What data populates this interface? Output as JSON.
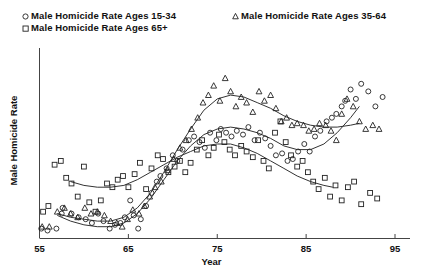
{
  "chart_data": {
    "type": "scatter",
    "title": "",
    "xlabel": "Year",
    "ylabel": "Male Homicide Rate",
    "xlim": [
      55,
      95
    ],
    "ylim": [
      0,
      100
    ],
    "xticks": [
      55,
      65,
      75,
      85,
      95
    ],
    "yticks": [],
    "grid": false,
    "legend_position": "top-left",
    "legend": [
      {
        "label": "Male Homicide Rate Ages 15-34",
        "marker": "circle"
      },
      {
        "label": "Male Homicide Rate Ages 35-64",
        "marker": "triangle"
      },
      {
        "label": "Male Homicide Rate Ages 65+",
        "marker": "square"
      }
    ],
    "series": [
      {
        "name": "Male Homicide Rate Ages 15-34",
        "marker": "circle",
        "points": [
          [
            55.2,
            5
          ],
          [
            55.9,
            4
          ],
          [
            56.9,
            5
          ],
          [
            57.5,
            13
          ],
          [
            57.6,
            16
          ],
          [
            58.6,
            13
          ],
          [
            59.4,
            11
          ],
          [
            60.2,
            10
          ],
          [
            60.9,
            8
          ],
          [
            61.6,
            13
          ],
          [
            62.2,
            9
          ],
          [
            62.9,
            5
          ],
          [
            63.5,
            7
          ],
          [
            64.1,
            8
          ],
          [
            64.6,
            11
          ],
          [
            65.2,
            20
          ],
          [
            65.6,
            12
          ],
          [
            66.1,
            5
          ],
          [
            66.4,
            10
          ],
          [
            67.0,
            17
          ],
          [
            67.6,
            24
          ],
          [
            68.2,
            30
          ],
          [
            68.6,
            33
          ],
          [
            69.3,
            37
          ],
          [
            70.0,
            44
          ],
          [
            70.5,
            41
          ],
          [
            71.1,
            47
          ],
          [
            71.8,
            52
          ],
          [
            72.4,
            54
          ],
          [
            73.0,
            51
          ],
          [
            73.6,
            48
          ],
          [
            74.2,
            56
          ],
          [
            74.9,
            52
          ],
          [
            75.4,
            58
          ],
          [
            76.0,
            56
          ],
          [
            76.6,
            54
          ],
          [
            77.2,
            57
          ],
          [
            77.9,
            55
          ],
          [
            78.5,
            59
          ],
          [
            79.2,
            52
          ],
          [
            79.8,
            56
          ],
          [
            80.4,
            53
          ],
          [
            81.0,
            49
          ],
          [
            81.6,
            44
          ],
          [
            82.3,
            45
          ],
          [
            82.9,
            41
          ],
          [
            83.5,
            42
          ],
          [
            84.1,
            46
          ],
          [
            84.8,
            50
          ],
          [
            85.4,
            46
          ],
          [
            86.0,
            54
          ],
          [
            86.6,
            57
          ],
          [
            87.3,
            62
          ],
          [
            87.9,
            64
          ],
          [
            88.4,
            66
          ],
          [
            89.0,
            70
          ],
          [
            89.4,
            73
          ],
          [
            90.0,
            79
          ],
          [
            90.6,
            74
          ],
          [
            91.2,
            82
          ],
          [
            92.0,
            78
          ],
          [
            92.8,
            70
          ],
          [
            93.6,
            75
          ]
        ]
      },
      {
        "name": "Male Homicide Rate Ages 35-64",
        "marker": "triangle",
        "points": [
          [
            55.3,
            6
          ],
          [
            56.1,
            6
          ],
          [
            57.0,
            14
          ],
          [
            57.8,
            16
          ],
          [
            58.5,
            13
          ],
          [
            59.3,
            11
          ],
          [
            60.1,
            16
          ],
          [
            60.8,
            13
          ],
          [
            61.5,
            14
          ],
          [
            62.3,
            12
          ],
          [
            63.0,
            9
          ],
          [
            63.7,
            8
          ],
          [
            64.3,
            6
          ],
          [
            64.9,
            10
          ],
          [
            65.5,
            15
          ],
          [
            66.2,
            13
          ],
          [
            66.8,
            17
          ],
          [
            67.4,
            22
          ],
          [
            68.0,
            27
          ],
          [
            68.7,
            30
          ],
          [
            69.4,
            36
          ],
          [
            70.1,
            42
          ],
          [
            70.8,
            48
          ],
          [
            71.5,
            52
          ],
          [
            72.1,
            58
          ],
          [
            72.8,
            64
          ],
          [
            73.4,
            72
          ],
          [
            74.0,
            76
          ],
          [
            74.6,
            81
          ],
          [
            75.3,
            73
          ],
          [
            75.9,
            85
          ],
          [
            76.5,
            78
          ],
          [
            77.1,
            70
          ],
          [
            77.7,
            75
          ],
          [
            78.3,
            72
          ],
          [
            79.0,
            67
          ],
          [
            79.7,
            78
          ],
          [
            80.3,
            73
          ],
          [
            81.0,
            76
          ],
          [
            81.6,
            69
          ],
          [
            82.2,
            62
          ],
          [
            82.8,
            64
          ],
          [
            83.4,
            60
          ],
          [
            84.0,
            61
          ],
          [
            84.7,
            60
          ],
          [
            85.3,
            57
          ],
          [
            85.9,
            58
          ],
          [
            86.5,
            61
          ],
          [
            87.2,
            60
          ],
          [
            87.8,
            57
          ],
          [
            88.4,
            52
          ],
          [
            89.0,
            66
          ],
          [
            89.6,
            74
          ],
          [
            90.3,
            70
          ],
          [
            91.0,
            62
          ],
          [
            91.7,
            58
          ],
          [
            92.5,
            60
          ],
          [
            93.2,
            58
          ]
        ]
      },
      {
        "name": "Male Homicide Rate Ages 65+",
        "marker": "square",
        "points": [
          [
            55.4,
            14
          ],
          [
            56.0,
            17
          ],
          [
            56.7,
            39
          ],
          [
            57.4,
            41
          ],
          [
            58.0,
            32
          ],
          [
            58.6,
            29
          ],
          [
            59.3,
            22
          ],
          [
            60.0,
            38
          ],
          [
            60.6,
            19
          ],
          [
            61.3,
            14
          ],
          [
            61.9,
            20
          ],
          [
            62.6,
            29
          ],
          [
            63.2,
            27
          ],
          [
            63.8,
            31
          ],
          [
            64.4,
            33
          ],
          [
            65.0,
            27
          ],
          [
            65.7,
            34
          ],
          [
            66.3,
            40
          ],
          [
            67.0,
            26
          ],
          [
            67.6,
            37
          ],
          [
            68.3,
            44
          ],
          [
            68.9,
            42
          ],
          [
            69.5,
            35
          ],
          [
            70.2,
            38
          ],
          [
            70.8,
            41
          ],
          [
            71.4,
            35
          ],
          [
            72.0,
            40
          ],
          [
            72.7,
            47
          ],
          [
            73.3,
            52
          ],
          [
            74.0,
            44
          ],
          [
            74.6,
            48
          ],
          [
            75.2,
            55
          ],
          [
            75.8,
            51
          ],
          [
            76.4,
            47
          ],
          [
            77.0,
            44
          ],
          [
            77.7,
            49
          ],
          [
            78.3,
            46
          ],
          [
            79.0,
            43
          ],
          [
            79.6,
            52
          ],
          [
            80.2,
            41
          ],
          [
            80.8,
            37
          ],
          [
            81.5,
            56
          ],
          [
            82.1,
            62
          ],
          [
            82.7,
            51
          ],
          [
            83.3,
            44
          ],
          [
            84.0,
            38
          ],
          [
            84.6,
            41
          ],
          [
            85.2,
            35
          ],
          [
            85.8,
            30
          ],
          [
            86.4,
            26
          ],
          [
            87.1,
            32
          ],
          [
            87.7,
            22
          ],
          [
            88.3,
            28
          ],
          [
            89.0,
            20
          ],
          [
            89.7,
            27
          ],
          [
            90.4,
            30
          ],
          [
            91.2,
            18
          ],
          [
            92.2,
            24
          ],
          [
            93.0,
            21
          ]
        ]
      }
    ],
    "fitted_curves": [
      {
        "name": "Male Homicide Rate Ages 15-34",
        "points": [
          [
            57.0,
            12
          ],
          [
            58.5,
            9
          ],
          [
            60.0,
            7
          ],
          [
            61.5,
            6
          ],
          [
            63.0,
            6
          ],
          [
            64.5,
            8
          ],
          [
            66.0,
            13
          ],
          [
            67.5,
            21
          ],
          [
            69.0,
            31
          ],
          [
            70.5,
            41
          ],
          [
            72.0,
            49
          ],
          [
            73.5,
            55
          ],
          [
            75.0,
            58
          ],
          [
            76.5,
            59
          ],
          [
            78.0,
            58
          ],
          [
            79.5,
            56
          ],
          [
            81.0,
            53
          ],
          [
            82.5,
            49
          ],
          [
            84.0,
            47
          ],
          [
            85.5,
            47
          ],
          [
            87.0,
            50
          ],
          [
            88.5,
            56
          ],
          [
            90.0,
            64
          ],
          [
            91.0,
            70
          ]
        ]
      },
      {
        "name": "Male Homicide Rate Ages 35-64",
        "points": [
          [
            57.0,
            13
          ],
          [
            58.5,
            11
          ],
          [
            60.0,
            10
          ],
          [
            61.5,
            9
          ],
          [
            63.0,
            9
          ],
          [
            64.5,
            11
          ],
          [
            66.0,
            16
          ],
          [
            67.5,
            24
          ],
          [
            69.0,
            35
          ],
          [
            70.5,
            47
          ],
          [
            72.0,
            58
          ],
          [
            73.5,
            68
          ],
          [
            75.0,
            74
          ],
          [
            76.5,
            76
          ],
          [
            78.0,
            75
          ],
          [
            79.5,
            72
          ],
          [
            81.0,
            69
          ],
          [
            82.5,
            65
          ],
          [
            84.0,
            62
          ],
          [
            85.5,
            60
          ],
          [
            87.0,
            59
          ],
          [
            88.5,
            59
          ],
          [
            90.0,
            60
          ],
          [
            91.0,
            61
          ]
        ]
      },
      {
        "name": "Male Homicide Rate Ages 65+",
        "points": [
          [
            58.5,
            30
          ],
          [
            60.0,
            28
          ],
          [
            61.5,
            27
          ],
          [
            63.0,
            27
          ],
          [
            64.5,
            28
          ],
          [
            66.0,
            31
          ],
          [
            67.5,
            35
          ],
          [
            69.0,
            39
          ],
          [
            70.5,
            43
          ],
          [
            72.0,
            46
          ],
          [
            73.5,
            49
          ],
          [
            75.0,
            50
          ],
          [
            76.5,
            50
          ],
          [
            78.0,
            48
          ],
          [
            79.5,
            45
          ],
          [
            81.0,
            41
          ],
          [
            82.5,
            37
          ],
          [
            84.0,
            33
          ],
          [
            85.5,
            30
          ],
          [
            87.0,
            28
          ],
          [
            88.0,
            27
          ]
        ]
      }
    ]
  }
}
